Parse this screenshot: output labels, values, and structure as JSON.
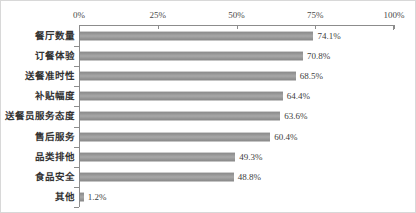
{
  "chart_data": {
    "type": "bar",
    "orientation": "horizontal",
    "title": "",
    "subtitle": "",
    "xlabel": "",
    "ylabel": "",
    "xlim": [
      0,
      100
    ],
    "grid": false,
    "legend": "none",
    "axis_position": "top",
    "tick_labels": [
      "0%",
      "25%",
      "50%",
      "75%",
      "100%"
    ],
    "ticks": [
      0,
      25,
      50,
      75,
      100
    ],
    "categories": [
      "餐厅数量",
      "订餐体验",
      "送餐准时性",
      "补贴幅度",
      "送餐员服务态度",
      "售后服务",
      "品类排他",
      "食品安全",
      "其他"
    ],
    "values": [
      74.1,
      70.8,
      68.5,
      64.4,
      63.6,
      60.4,
      49.3,
      48.8,
      1.2
    ],
    "value_labels": [
      "74.1%",
      "70.8%",
      "68.5%",
      "64.4%",
      "63.6%",
      "60.4%",
      "49.3%",
      "48.8%",
      "1.2%"
    ],
    "colors": {
      "bar": "#a0a0a0",
      "bar_edge": "#8a8a8a",
      "axis": "#8c8c8c",
      "text": "#333333",
      "background": "#ffffff",
      "border": "#d8d8d8"
    }
  }
}
